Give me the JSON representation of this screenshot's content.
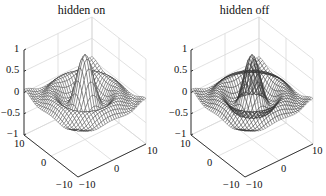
{
  "chart_data": [
    {
      "type": "surface-mesh",
      "title": "hidden on",
      "function": "z = sin(r)/r, r = sqrt(x^2 + y^2)",
      "hidden_line_removal": true,
      "xlim": [
        -10,
        10
      ],
      "ylim": [
        -10,
        10
      ],
      "zlim": [
        -1,
        1
      ],
      "x_ticks": [
        "-10",
        "0",
        "10"
      ],
      "y_ticks": [
        "-10",
        "0",
        "10"
      ],
      "z_ticks": [
        "-1",
        "-0.5",
        "0",
        "0.5",
        "1"
      ],
      "grid": true,
      "view": "default 3-D (az -37.5, el 30)"
    },
    {
      "type": "surface-mesh",
      "title": "hidden off",
      "function": "z = sin(r)/r, r = sqrt(x^2 + y^2)",
      "hidden_line_removal": false,
      "xlim": [
        -10,
        10
      ],
      "ylim": [
        -10,
        10
      ],
      "zlim": [
        -1,
        1
      ],
      "x_ticks": [
        "-10",
        "0",
        "10"
      ],
      "y_ticks": [
        "-10",
        "0",
        "10"
      ],
      "z_ticks": [
        "-1",
        "-0.5",
        "0",
        "0.5",
        "1"
      ],
      "grid": true,
      "view": "default 3-D (az -37.5, el 30)"
    }
  ],
  "panels": [
    {
      "title": "hidden on",
      "z_ticks": [
        "1",
        "0.5",
        "0",
        "−0.5",
        "−1"
      ],
      "y_ticks": [
        "10",
        "0",
        "−10"
      ],
      "x_ticks": [
        "−10",
        "0",
        "10"
      ]
    },
    {
      "title": "hidden off",
      "z_ticks": [
        "1",
        "0.5",
        "0",
        "−0.5",
        "−1"
      ],
      "y_ticks": [
        "10",
        "0",
        "−10"
      ],
      "x_ticks": [
        "−10",
        "0",
        "10"
      ]
    }
  ],
  "colors": {
    "mesh_line": "#3a3a3a",
    "mesh_face": "#ffffff",
    "grid": "#d9d9d9",
    "axis": "#222222"
  }
}
